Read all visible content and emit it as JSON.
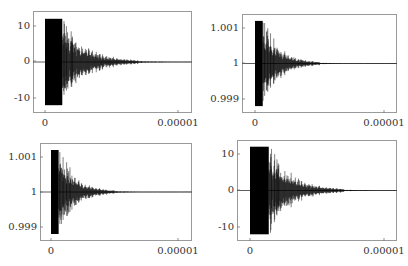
{
  "chart_data": [
    {
      "id": "top-left",
      "type": "line",
      "title": "",
      "xlabel": "",
      "ylabel": "",
      "x_ticks": [
        "0",
        "0.00001"
      ],
      "y_ticks": [
        "10",
        "0",
        "-10"
      ],
      "y_tick_values": [
        10,
        0,
        -10
      ],
      "ylim": [
        -14,
        14
      ],
      "xlim": [
        -9e-07,
        1.1e-06
      ],
      "signal": {
        "description": "Decaying oscillation clipped at ±12, dense from x=0 to ~1.2e-6, decays to ~0 by ~7e-6",
        "baseline": 0,
        "clip": 12,
        "clip_end_x": 1.3e-06,
        "decay_end_x": 7e-06,
        "peak_amplitude": 12
      },
      "grid": false,
      "legend": null
    },
    {
      "id": "top-right",
      "type": "line",
      "title": "",
      "xlabel": "",
      "ylabel": "",
      "x_ticks": [
        "0",
        "0.00001"
      ],
      "y_ticks": [
        "1.001",
        "1",
        "0.999"
      ],
      "y_tick_values": [
        1.001,
        1,
        0.999
      ],
      "ylim": [
        0.9986,
        1.0014
      ],
      "signal": {
        "description": "Decaying oscillation about 1, clipped at 1 ± 0.0012, dense from x=0 to ~0.6e-6, decays by ~5e-6",
        "baseline": 1,
        "clip": 0.0012,
        "clip_end_x": 6e-07,
        "decay_end_x": 5e-06,
        "peak_amplitude": 0.0012
      },
      "grid": false,
      "legend": null
    },
    {
      "id": "bottom-left",
      "type": "line",
      "title": "",
      "xlabel": "",
      "ylabel": "",
      "x_ticks": [
        "0",
        "0.00001"
      ],
      "y_ticks": [
        "1.001",
        "1",
        "0.999"
      ],
      "y_tick_values": [
        1.001,
        1,
        0.999
      ],
      "ylim": [
        0.9986,
        1.0014
      ],
      "signal": {
        "description": "Decaying oscillation about 1, clipped at 1 ± 0.0012, dense from x=0 to ~0.6e-6, decays by ~5e-6",
        "baseline": 1,
        "clip": 0.0012,
        "clip_end_x": 6e-07,
        "decay_end_x": 5e-06,
        "peak_amplitude": 0.0012
      },
      "grid": false,
      "legend": null
    },
    {
      "id": "bottom-right",
      "type": "line",
      "title": "",
      "xlabel": "",
      "ylabel": "",
      "x_ticks": [
        "0",
        "0.00001"
      ],
      "y_ticks": [
        "10",
        "0",
        "-10"
      ],
      "y_tick_values": [
        10,
        0,
        -10
      ],
      "ylim": [
        -14,
        14
      ],
      "signal": {
        "description": "Decaying oscillation clipped at ±12, dense from x=0 to ~1.4e-6, decays to ~0 by ~7e-6",
        "baseline": 0,
        "clip": 12,
        "clip_end_x": 1.4e-06,
        "decay_end_x": 7e-06,
        "peak_amplitude": 12
      },
      "grid": false,
      "legend": null
    }
  ],
  "layout": {
    "panels": [
      {
        "frame": {
          "left": 33,
          "top": 11,
          "right": 192,
          "bottom": 113
        },
        "x0_px": 45,
        "x1_px": 178,
        "ytick_px": [
          26,
          61,
          98
        ],
        "xtick_label_y": 118
      },
      {
        "frame": {
          "left": 242,
          "top": 14,
          "right": 397,
          "bottom": 113
        },
        "x0_px": 255,
        "x1_px": 384,
        "ytick_px": [
          28,
          63,
          99
        ],
        "xtick_label_y": 118
      },
      {
        "frame": {
          "left": 40,
          "top": 143,
          "right": 192,
          "bottom": 241
        },
        "x0_px": 51,
        "x1_px": 178,
        "ytick_px": [
          157,
          192,
          227
        ],
        "xtick_label_y": 246
      },
      {
        "frame": {
          "left": 237,
          "top": 140,
          "right": 397,
          "bottom": 241
        },
        "x0_px": 250,
        "x1_px": 384,
        "ytick_px": [
          154,
          190,
          227
        ],
        "xtick_label_y": 246
      }
    ]
  },
  "colors": {
    "signal": "#000000",
    "frame": "#9a9a9a",
    "text": "#333333",
    "background": "#ffffff"
  }
}
